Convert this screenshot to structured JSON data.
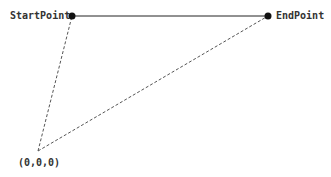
{
  "diagram": {
    "start_label": "StartPoint",
    "end_label": "EndPoint",
    "origin_label": "(0,0,0)",
    "colors": {
      "line": "#222222",
      "dashed": "#555555",
      "text": "#333333"
    }
  }
}
